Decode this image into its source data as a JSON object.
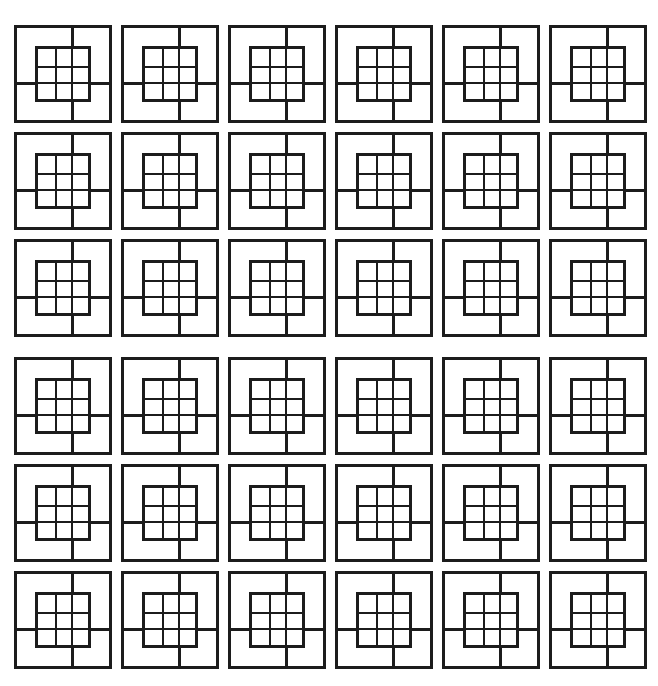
{
  "figure": {
    "background_color": "#ffffff",
    "line_color": "#1c1c1c",
    "canvas": {
      "width": 658,
      "height": 686
    }
  },
  "pattern": {
    "columns": 6,
    "rows": 6,
    "total_tiles": 36,
    "tile_size": 98,
    "column_pitch": 107,
    "row_pitch": 107,
    "origin_x": 14,
    "origin_y": 25,
    "extra_row_gap_after_row": 3,
    "extra_row_gap": 11,
    "column_offsets": [
      14,
      121,
      228,
      335,
      442,
      549
    ],
    "row_offsets": [
      25,
      132,
      239,
      357,
      464,
      571
    ]
  },
  "tile": {
    "name": "nested-square-grid-motif",
    "outer_border_width": 3.0,
    "inner_border_width": 3.0,
    "inner_grid_size": 56,
    "inner_grid_offset": 21,
    "inner_divisions": 3,
    "inner_line_width": 2.4,
    "stub_width": 2.8,
    "stub_alignment": {
      "top": "second vertical inner gridline",
      "bottom": "second vertical inner gridline",
      "left": "second horizontal inner gridline",
      "right": "second horizontal inner gridline"
    }
  },
  "chart_data": {
    "type": "heatmap",
    "xlabel": "",
    "ylabel": "",
    "categories": [
      "c1",
      "c2",
      "c3",
      "c4",
      "c5",
      "c6"
    ],
    "row_labels": [
      "r1",
      "r2",
      "r3",
      "r4",
      "r5",
      "r6"
    ],
    "series": [
      {
        "name": "r1",
        "values": [
          1,
          1,
          1,
          1,
          1,
          1
        ]
      },
      {
        "name": "r2",
        "values": [
          1,
          1,
          1,
          1,
          1,
          1
        ]
      },
      {
        "name": "r3",
        "values": [
          1,
          1,
          1,
          1,
          1,
          1
        ]
      },
      {
        "name": "r4",
        "values": [
          1,
          1,
          1,
          1,
          1,
          1
        ]
      },
      {
        "name": "r5",
        "values": [
          1,
          1,
          1,
          1,
          1,
          1
        ]
      },
      {
        "name": "r6",
        "values": [
          1,
          1,
          1,
          1,
          1,
          1
        ]
      }
    ],
    "legend": [],
    "grid": false
  }
}
